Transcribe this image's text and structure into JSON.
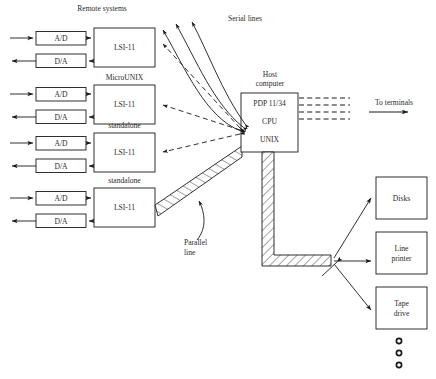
{
  "figure": {
    "title_text": "Remote systems",
    "serial_lines_label": "Serial lines",
    "parallel_line_label_1": "Parallel",
    "parallel_line_label_2": "line",
    "to_terminals_label": "To terminals"
  },
  "remote_systems": [
    {
      "adc_label": "A/D",
      "dac_label": "D/A",
      "computer_label": "LSI-11",
      "os_label": ""
    },
    {
      "adc_label": "A/D",
      "dac_label": "D/A",
      "computer_label": "LSI-11",
      "os_label": "MicroUNIX"
    },
    {
      "adc_label": "A/D",
      "dac_label": "D/A",
      "computer_label": "LSI-11",
      "os_label": "standalone"
    },
    {
      "adc_label": "A/D",
      "dac_label": "D/A",
      "computer_label": "LSI-11",
      "os_label": "standalone"
    }
  ],
  "host": {
    "caption_line1": "Host",
    "caption_line2": "computer",
    "model_label": "PDP 11/34",
    "cpu_label": "CPU",
    "os_label": "UNIX"
  },
  "peripherals": [
    {
      "label_line1": "Disks",
      "label_line2": ""
    },
    {
      "label_line1": "Line",
      "label_line2": "printer"
    },
    {
      "label_line1": "Tape",
      "label_line2": "drive"
    }
  ],
  "ellipsis_dots": 3,
  "colors": {
    "stroke": "#1a1a1a",
    "text": "#2b2b2b",
    "background": "#ffffff"
  }
}
